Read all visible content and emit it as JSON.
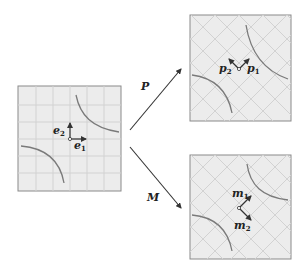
{
  "figure": {
    "left_panel": {
      "grid": "axis-aligned",
      "vectors": [
        {
          "label": "e",
          "subscript": "2",
          "direction": "up"
        },
        {
          "label": "e",
          "subscript": "1",
          "direction": "right"
        }
      ]
    },
    "top_right_panel": {
      "grid": "diagonal",
      "vectors": [
        {
          "label": "p",
          "subscript": "2",
          "direction": "up-left"
        },
        {
          "label": "p",
          "subscript": "1",
          "direction": "up-right"
        }
      ]
    },
    "bottom_right_panel": {
      "grid": "diagonal",
      "vectors": [
        {
          "label": "m",
          "subscript": "1",
          "direction": "up-right"
        },
        {
          "label": "m",
          "subscript": "2",
          "direction": "down-right"
        }
      ]
    },
    "arrows": [
      {
        "label": "P",
        "to": "top_right_panel"
      },
      {
        "label": "M",
        "to": "bottom_right_panel"
      }
    ],
    "colors": {
      "panel_fill": "#ececec",
      "grid_line": "#d2d2d2",
      "border": "#8a8a8a",
      "curve": "#7a7a7a",
      "arrow": "#333333"
    }
  }
}
